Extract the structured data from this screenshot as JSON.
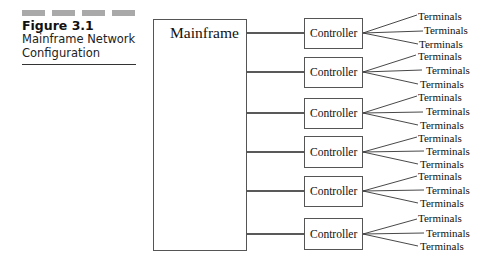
{
  "caption": {
    "decor_bars": 4,
    "figure_number": "Figure 3.1",
    "title_line1": "Mainframe Network",
    "title_line2": "Configuration"
  },
  "diagram": {
    "mainframe_label": "Mainframe",
    "controllers": [
      {
        "label": "Controller",
        "terminals": [
          "Terminals",
          "Terminals",
          "Terminals"
        ]
      },
      {
        "label": "Controller",
        "terminals": [
          "Terminals",
          "Terminals",
          "Terminals"
        ]
      },
      {
        "label": "Controller",
        "terminals": [
          "Terminals",
          "Terminals",
          "Terminals"
        ]
      },
      {
        "label": "Controller",
        "terminals": [
          "Terminals",
          "Terminals",
          "Terminals"
        ]
      },
      {
        "label": "Controller",
        "terminals": [
          "Terminals",
          "Terminals",
          "Terminals"
        ]
      },
      {
        "label": "Controller",
        "terminals": [
          "Terminals",
          "Terminals",
          "Terminals"
        ]
      }
    ],
    "colors": {
      "line": "#222222",
      "box_border": "#555555",
      "decor_bar": "#a9a9a9"
    }
  }
}
